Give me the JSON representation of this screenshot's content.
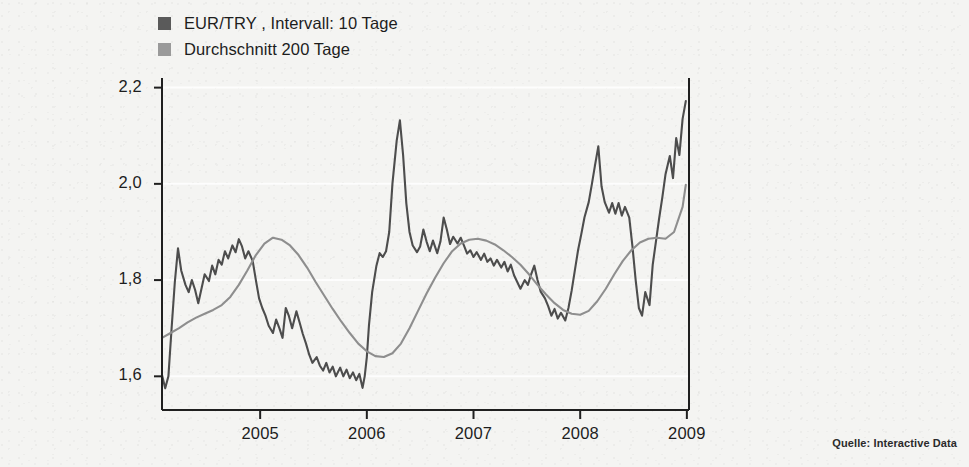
{
  "legend": {
    "items": [
      {
        "label": "EUR/TRY , Intervall: 10 Tage",
        "color": "#5a5a5a"
      },
      {
        "label": "Durchschnitt 200 Tage",
        "color": "#9a9a9a"
      }
    ]
  },
  "source": {
    "text": "Quelle: Interactive Data"
  },
  "axes": {
    "y_ticks": [
      "2,2",
      "2,0",
      "1,8",
      "1,6"
    ],
    "x_ticks": [
      "2005",
      "2006",
      "2007",
      "2008",
      "2009"
    ]
  },
  "chart_data": {
    "type": "line",
    "title": "",
    "subtitle": "",
    "xlabel": "",
    "ylabel": "",
    "xlim": [
      2004.08,
      2009.02
    ],
    "ylim": [
      1.53,
      2.22
    ],
    "ytick_values": [
      2.2,
      2.0,
      1.8,
      1.6
    ],
    "ytick_labels": [
      "2,2",
      "2,0",
      "1,8",
      "1,6"
    ],
    "xtick_values": [
      2005,
      2006,
      2007,
      2008,
      2009
    ],
    "xtick_labels": [
      "2005",
      "2006",
      "2007",
      "2008",
      "2009"
    ],
    "grid": "faint-horizontal",
    "legend_position": "above-left",
    "series": [
      {
        "name": "EUR/TRY , Intervall: 10 Tage",
        "color": "#4d4d4d",
        "width": 2.1,
        "x": [
          2004.08,
          2004.11,
          2004.14,
          2004.17,
          2004.2,
          2004.23,
          2004.26,
          2004.3,
          2004.33,
          2004.36,
          2004.39,
          2004.42,
          2004.45,
          2004.48,
          2004.52,
          2004.55,
          2004.58,
          2004.61,
          2004.64,
          2004.67,
          2004.7,
          2004.74,
          2004.77,
          2004.8,
          2004.83,
          2004.86,
          2004.89,
          2004.93,
          2004.96,
          2004.99,
          2005.02,
          2005.05,
          2005.08,
          2005.12,
          2005.15,
          2005.18,
          2005.21,
          2005.24,
          2005.27,
          2005.3,
          2005.34,
          2005.37,
          2005.4,
          2005.43,
          2005.46,
          2005.49,
          2005.53,
          2005.56,
          2005.59,
          2005.62,
          2005.65,
          2005.68,
          2005.71,
          2005.75,
          2005.78,
          2005.81,
          2005.84,
          2005.87,
          2005.9,
          2005.93,
          2005.96,
          2005.98,
          2006.0,
          2006.02,
          2006.05,
          2006.09,
          2006.12,
          2006.15,
          2006.18,
          2006.21,
          2006.24,
          2006.28,
          2006.31,
          2006.34,
          2006.37,
          2006.4,
          2006.43,
          2006.47,
          2006.5,
          2006.53,
          2006.56,
          2006.59,
          2006.62,
          2006.66,
          2006.69,
          2006.72,
          2006.75,
          2006.78,
          2006.81,
          2006.85,
          2006.88,
          2006.91,
          2006.94,
          2006.97,
          2007.0,
          2007.03,
          2007.07,
          2007.1,
          2007.13,
          2007.16,
          2007.19,
          2007.22,
          2007.26,
          2007.29,
          2007.32,
          2007.35,
          2007.38,
          2007.41,
          2007.44,
          2007.48,
          2007.51,
          2007.54,
          2007.57,
          2007.6,
          2007.63,
          2007.67,
          2007.7,
          2007.73,
          2007.76,
          2007.79,
          2007.82,
          2007.86,
          2007.89,
          2007.92,
          2007.95,
          2007.98,
          2008.01,
          2008.04,
          2008.08,
          2008.11,
          2008.14,
          2008.17,
          2008.2,
          2008.23,
          2008.27,
          2008.3,
          2008.33,
          2008.36,
          2008.39,
          2008.42,
          2008.46,
          2008.49,
          2008.52,
          2008.55,
          2008.58,
          2008.61,
          2008.65,
          2008.68,
          2008.71,
          2008.74,
          2008.77,
          2008.8,
          2008.84,
          2008.87,
          2008.9,
          2008.93,
          2008.96,
          2008.99
        ],
        "y": [
          1.603,
          1.575,
          1.6,
          1.7,
          1.795,
          1.866,
          1.82,
          1.79,
          1.775,
          1.8,
          1.78,
          1.752,
          1.782,
          1.812,
          1.798,
          1.83,
          1.812,
          1.842,
          1.832,
          1.86,
          1.845,
          1.872,
          1.858,
          1.885,
          1.87,
          1.845,
          1.86,
          1.84,
          1.8,
          1.762,
          1.742,
          1.726,
          1.705,
          1.69,
          1.718,
          1.7,
          1.68,
          1.742,
          1.725,
          1.7,
          1.735,
          1.712,
          1.688,
          1.668,
          1.645,
          1.628,
          1.64,
          1.622,
          1.612,
          1.628,
          1.608,
          1.62,
          1.6,
          1.618,
          1.6,
          1.614,
          1.596,
          1.608,
          1.592,
          1.605,
          1.576,
          1.6,
          1.64,
          1.706,
          1.775,
          1.83,
          1.856,
          1.848,
          1.86,
          1.9,
          2.0,
          2.09,
          2.132,
          2.06,
          1.96,
          1.9,
          1.872,
          1.858,
          1.87,
          1.905,
          1.88,
          1.86,
          1.882,
          1.856,
          1.88,
          1.93,
          1.905,
          1.875,
          1.89,
          1.876,
          1.888,
          1.872,
          1.855,
          1.862,
          1.848,
          1.858,
          1.842,
          1.855,
          1.838,
          1.845,
          1.83,
          1.842,
          1.826,
          1.838,
          1.818,
          1.832,
          1.81,
          1.796,
          1.782,
          1.8,
          1.79,
          1.812,
          1.83,
          1.8,
          1.776,
          1.762,
          1.746,
          1.726,
          1.74,
          1.72,
          1.732,
          1.716,
          1.742,
          1.778,
          1.82,
          1.862,
          1.895,
          1.93,
          1.962,
          2.0,
          2.04,
          2.078,
          1.995,
          1.962,
          1.94,
          1.96,
          1.938,
          1.96,
          1.934,
          1.952,
          1.93,
          1.87,
          1.8,
          1.742,
          1.726,
          1.775,
          1.748,
          1.832,
          1.88,
          1.928,
          1.972,
          2.02,
          2.058,
          2.012,
          2.095,
          2.06,
          2.135,
          2.172
        ]
      },
      {
        "name": "Durchschnitt 200 Tage",
        "color": "#8e8e8e",
        "width": 2.1,
        "x": [
          2004.08,
          2004.16,
          2004.24,
          2004.32,
          2004.4,
          2004.48,
          2004.56,
          2004.64,
          2004.72,
          2004.8,
          2004.88,
          2004.96,
          2005.04,
          2005.12,
          2005.2,
          2005.28,
          2005.36,
          2005.44,
          2005.52,
          2005.6,
          2005.68,
          2005.76,
          2005.84,
          2005.92,
          2006.0,
          2006.08,
          2006.16,
          2006.24,
          2006.32,
          2006.4,
          2006.48,
          2006.56,
          2006.64,
          2006.72,
          2006.8,
          2006.88,
          2006.96,
          2007.04,
          2007.12,
          2007.2,
          2007.28,
          2007.36,
          2007.44,
          2007.52,
          2007.6,
          2007.68,
          2007.76,
          2007.84,
          2007.92,
          2008.0,
          2008.08,
          2008.16,
          2008.24,
          2008.32,
          2008.4,
          2008.48,
          2008.56,
          2008.64,
          2008.72,
          2008.8,
          2008.88,
          2008.96,
          2008.99
        ],
        "y": [
          1.68,
          1.69,
          1.7,
          1.712,
          1.722,
          1.73,
          1.738,
          1.748,
          1.765,
          1.79,
          1.82,
          1.852,
          1.876,
          1.888,
          1.884,
          1.872,
          1.852,
          1.826,
          1.796,
          1.768,
          1.74,
          1.714,
          1.69,
          1.668,
          1.652,
          1.642,
          1.64,
          1.648,
          1.668,
          1.7,
          1.736,
          1.772,
          1.805,
          1.835,
          1.86,
          1.876,
          1.884,
          1.886,
          1.882,
          1.874,
          1.862,
          1.848,
          1.832,
          1.812,
          1.79,
          1.77,
          1.752,
          1.738,
          1.73,
          1.728,
          1.736,
          1.756,
          1.782,
          1.812,
          1.84,
          1.862,
          1.878,
          1.886,
          1.888,
          1.886,
          1.9,
          1.952,
          1.998
        ]
      }
    ]
  },
  "colors": {
    "background": "#f4f4f2",
    "axis": "#1f1f1f",
    "gridline": "#ffffff"
  }
}
